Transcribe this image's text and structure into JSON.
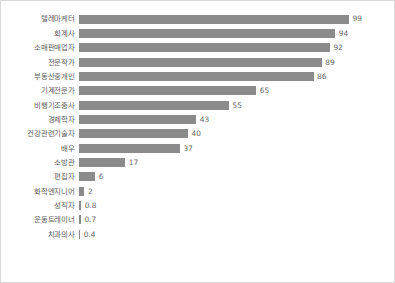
{
  "chart_data": {
    "type": "bar",
    "orientation": "horizontal",
    "title": "",
    "subtitle": "",
    "xlabel": "",
    "ylabel": "",
    "xlim": [
      0,
      99
    ],
    "grid": false,
    "legend": false,
    "bar_color": "#8b8b8b",
    "label_color": "#5d5d5d",
    "value_color": "#6a6a6a",
    "background_color": "#ffffff",
    "border_color": "#d9d9d9",
    "categories": [
      "텔레마케터",
      "회계사",
      "소매판매업자",
      "전문작가",
      "부동산중개인",
      "기계전문가",
      "비행기조종사",
      "경제학자",
      "건강관련기술자",
      "배우",
      "소방관",
      "편집자",
      "화학엔지니어",
      "성직자",
      "운동트레이너",
      "치과의사"
    ],
    "values": [
      99,
      94,
      92,
      89,
      86,
      65,
      55,
      43,
      40,
      37,
      17,
      6,
      2,
      0.8,
      0.7,
      0.4
    ],
    "value_labels": [
      "99",
      "94",
      "92",
      "89",
      "86",
      "65",
      "55",
      "43",
      "40",
      "37",
      "17",
      "6",
      "2",
      "0.8",
      "0.7",
      "0.4"
    ]
  }
}
